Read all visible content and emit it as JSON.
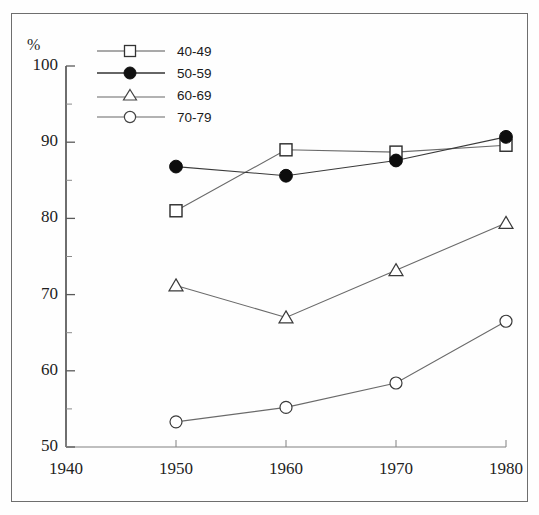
{
  "figure": {
    "unit_label": "%",
    "border_color": "#6e6e6e",
    "background": "#fefefe"
  },
  "legend": {
    "position": "top-left-inside",
    "entries": [
      {
        "label": "40-49",
        "marker": "open-square",
        "color": "#333333"
      },
      {
        "label": "50-59",
        "marker": "filled-circle",
        "color": "#111111"
      },
      {
        "label": "60-69",
        "marker": "open-triangle",
        "color": "#444444"
      },
      {
        "label": "70-79",
        "marker": "open-circle",
        "color": "#444444"
      }
    ]
  },
  "chart_data": {
    "type": "line",
    "title": "",
    "subtitle": "",
    "xlabel": "",
    "ylabel": "%",
    "x": [
      1950,
      1960,
      1970,
      1980
    ],
    "xlim": [
      1940,
      1980
    ],
    "ylim": [
      50,
      100
    ],
    "xticks": [
      1940,
      1950,
      1960,
      1970,
      1980
    ],
    "yticks": [
      50,
      60,
      70,
      80,
      90,
      100
    ],
    "y_minor_ticks": [
      55,
      65,
      75,
      85,
      95
    ],
    "grid": false,
    "legend_position": "upper left",
    "series": [
      {
        "name": "40-49",
        "marker": "open-square",
        "values": [
          81.0,
          89.0,
          88.7,
          89.6
        ]
      },
      {
        "name": "50-59",
        "marker": "filled-circle",
        "values": [
          86.8,
          85.6,
          87.6,
          90.7
        ]
      },
      {
        "name": "60-69",
        "marker": "open-triangle",
        "values": [
          71.2,
          67.0,
          73.2,
          79.4
        ]
      },
      {
        "name": "70-79",
        "marker": "open-circle",
        "values": [
          53.3,
          55.2,
          58.4,
          66.5
        ]
      }
    ]
  },
  "axes": {
    "y_tick_labels": [
      "100",
      "90",
      "80",
      "70",
      "60",
      "50"
    ],
    "x_tick_labels": [
      "1940",
      "1950",
      "1960",
      "1970",
      "1980"
    ]
  }
}
